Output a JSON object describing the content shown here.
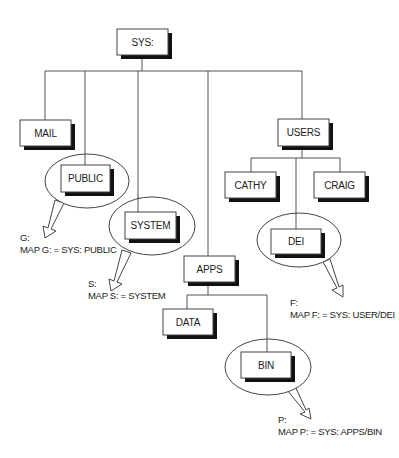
{
  "diagram": {
    "root": {
      "label": "SYS:"
    },
    "nodes": {
      "sys": {
        "label": "SYS:"
      },
      "mail": {
        "label": "MAIL"
      },
      "public": {
        "label": "PUBLIC"
      },
      "system": {
        "label": "SYSTEM"
      },
      "apps": {
        "label": "APPS"
      },
      "users": {
        "label": "USERS"
      },
      "cathy": {
        "label": "CATHY"
      },
      "craig": {
        "label": "CRAIG"
      },
      "dei": {
        "label": "DEI"
      },
      "data": {
        "label": "DATA"
      },
      "bin": {
        "label": "BIN"
      }
    },
    "mappings": {
      "g": {
        "drive": "G:",
        "command": "MAP G: = SYS: PUBLIC"
      },
      "s": {
        "drive": "S:",
        "command": "MAP S: = SYSTEM"
      },
      "f": {
        "drive": "F:",
        "command": "MAP F: = SYS: USER/DEI"
      },
      "p": {
        "drive": "P:",
        "command": "MAP P: = SYS: APPS/BIN"
      }
    },
    "edges": [
      [
        "SYS:",
        "MAIL"
      ],
      [
        "SYS:",
        "PUBLIC"
      ],
      [
        "SYS:",
        "SYSTEM"
      ],
      [
        "SYS:",
        "APPS"
      ],
      [
        "SYS:",
        "USERS"
      ],
      [
        "USERS",
        "CATHY"
      ],
      [
        "USERS",
        "DEI"
      ],
      [
        "USERS",
        "CRAIG"
      ],
      [
        "APPS",
        "DATA"
      ],
      [
        "APPS",
        "BIN"
      ]
    ],
    "highlighted": [
      "PUBLIC",
      "SYSTEM",
      "DEI",
      "BIN"
    ]
  }
}
